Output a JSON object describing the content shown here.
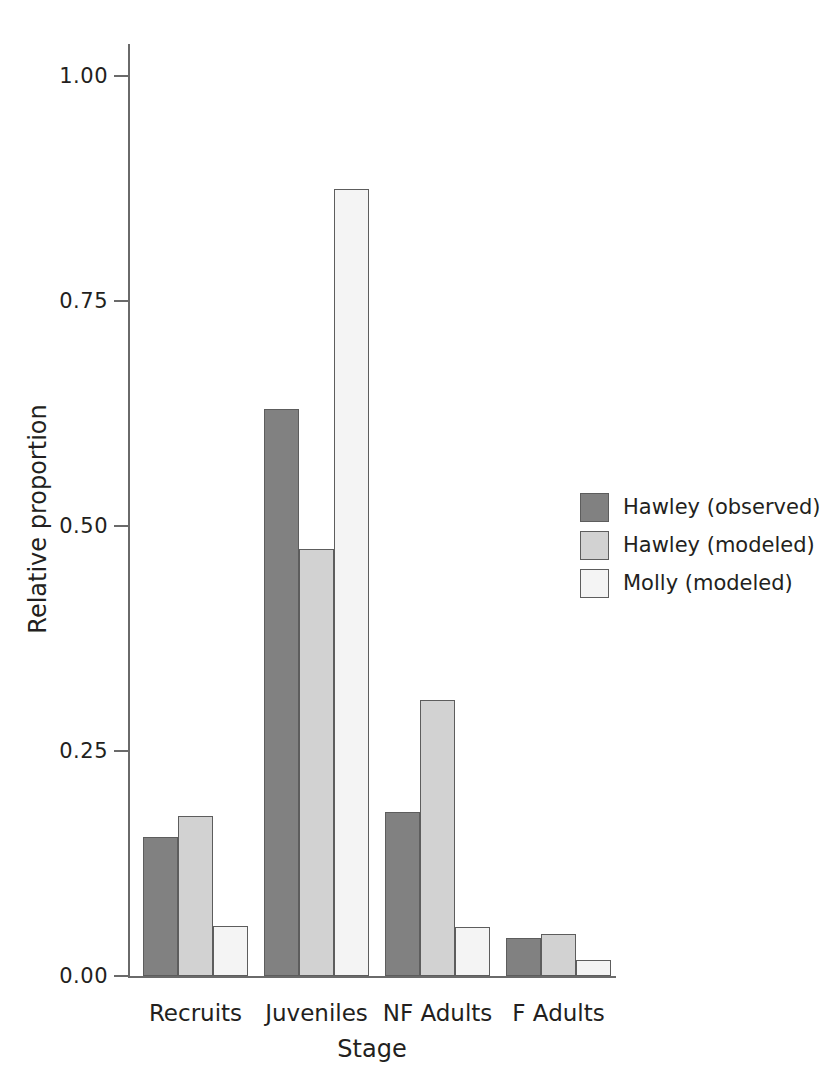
{
  "chart_data": {
    "type": "bar",
    "title": "",
    "xlabel": "Stage",
    "ylabel": "Relative proportion",
    "categories": [
      "Recruits",
      "Juveniles",
      "NF Adults",
      "F Adults"
    ],
    "series": [
      {
        "name": "Hawley (observed)",
        "color": "#818181",
        "values": [
          0.155,
          0.63,
          0.182,
          0.042
        ]
      },
      {
        "name": "Hawley (modeled)",
        "color": "#d2d2d2",
        "values": [
          0.178,
          0.475,
          0.307,
          0.047
        ]
      },
      {
        "name": "Molly (modeled)",
        "color": "#f4f4f4",
        "values": [
          0.056,
          0.875,
          0.055,
          0.018
        ]
      }
    ],
    "ylim": [
      0.0,
      1.0
    ],
    "yticks": [
      0.0,
      0.25,
      0.5,
      0.75,
      1.0
    ],
    "ytick_labels": [
      "0.00",
      "0.25",
      "0.50",
      "0.75",
      "1.00"
    ],
    "grid": false,
    "legend_position": "right",
    "bar_edge_color": "#5d5d5d",
    "axis_color": "#6a6a6a"
  },
  "legend": {
    "entries": [
      {
        "label": "Hawley (observed)",
        "color": "#818181"
      },
      {
        "label": "Hawley (modeled)",
        "color": "#d2d2d2"
      },
      {
        "label": "Molly (modeled)",
        "color": "#f4f4f4"
      }
    ]
  }
}
